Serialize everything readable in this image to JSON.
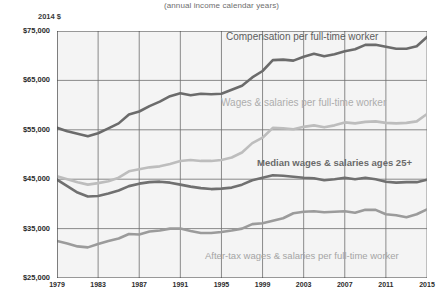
{
  "chart_data": {
    "type": "line",
    "title": "",
    "subtitle": "(annual  income calendar years)",
    "xlabel": "",
    "ylabel": "2014 $",
    "ylim": [
      25000,
      75000
    ],
    "xlim": [
      1979,
      2015
    ],
    "grid": true,
    "legend_position": "inline-annotations",
    "y_tick_labels": [
      "$75,000",
      "$65,000",
      "$55,000",
      "$45,000",
      "$35,000",
      "$25,000"
    ],
    "y_tick_values": [
      75000,
      65000,
      55000,
      45000,
      35000,
      25000
    ],
    "x_tick_labels": [
      "1979",
      "1983",
      "1987",
      "1991",
      "1995",
      "1999",
      "2003",
      "2007",
      "2011",
      "2015"
    ],
    "x_tick_values": [
      1979,
      1983,
      1987,
      1991,
      1995,
      1999,
      2003,
      2007,
      2011,
      2015
    ],
    "x": [
      1979,
      1980,
      1981,
      1982,
      1983,
      1984,
      1985,
      1986,
      1987,
      1988,
      1989,
      1990,
      1991,
      1992,
      1993,
      1994,
      1995,
      1996,
      1997,
      1998,
      1999,
      2000,
      2001,
      2002,
      2003,
      2004,
      2005,
      2006,
      2007,
      2008,
      2009,
      2010,
      2011,
      2012,
      2013,
      2014,
      2015
    ],
    "series": [
      {
        "name": "Compensation per full-time worker",
        "color": "#6b6b6b",
        "width": 2.6,
        "values": [
          55400,
          54700,
          54200,
          53700,
          54300,
          55300,
          56300,
          58100,
          58700,
          59800,
          60700,
          61800,
          62400,
          62000,
          62300,
          62200,
          62300,
          63100,
          63900,
          65600,
          66900,
          69100,
          69200,
          69000,
          69800,
          70400,
          69900,
          70300,
          70900,
          71300,
          72200,
          72200,
          71800,
          71400,
          71400,
          71900,
          73800
        ]
      },
      {
        "name": "Wages & salaries per full-time worker",
        "color": "#bdbdbd",
        "width": 2.6,
        "values": [
          45600,
          45000,
          44400,
          43900,
          44200,
          44600,
          45300,
          46600,
          47000,
          47400,
          47600,
          48100,
          48700,
          48900,
          48700,
          48700,
          48900,
          49400,
          50400,
          52300,
          53400,
          55400,
          55300,
          55100,
          55600,
          55900,
          55500,
          55900,
          56500,
          56300,
          56600,
          56700,
          56400,
          56300,
          56400,
          56700,
          58200
        ]
      },
      {
        "name": "Median wages & salaries ages 25+",
        "color": "#707070",
        "width": 2.6,
        "values": [
          44900,
          43600,
          42300,
          41500,
          41600,
          42100,
          42700,
          43600,
          44100,
          44400,
          44500,
          44300,
          43900,
          43500,
          43200,
          43000,
          43100,
          43300,
          43900,
          44800,
          45300,
          45800,
          45700,
          45500,
          45300,
          45200,
          44800,
          45000,
          45300,
          45000,
          45300,
          45000,
          44500,
          44300,
          44400,
          44400,
          44900
        ]
      },
      {
        "name": "After-tax wages & salaries per full-time worker",
        "color": "#9b9b9b",
        "width": 2.6,
        "values": [
          32500,
          32000,
          31400,
          31200,
          31900,
          32500,
          33000,
          33900,
          33800,
          34400,
          34600,
          35000,
          35000,
          34500,
          34100,
          34100,
          34300,
          34600,
          35000,
          35900,
          36100,
          36600,
          37100,
          38100,
          38400,
          38500,
          38300,
          38400,
          38500,
          38200,
          38800,
          38800,
          37900,
          37700,
          37300,
          37900,
          38900
        ]
      }
    ],
    "annotations": [
      {
        "id": "compensation",
        "text": "Compensation per full-time worker"
      },
      {
        "id": "wages-salaries",
        "text": "Wages & salaries per full-time worker"
      },
      {
        "id": "median-wages",
        "text": "Median wages & salaries ages 25+"
      },
      {
        "id": "after-tax",
        "text": "After-tax wages & salaries per full-time worker"
      }
    ],
    "colors": {
      "plot_background": "#f4f4f4",
      "page_background": "#ffffff",
      "gridline": "#6f6f6f",
      "axis": "#3c3c3c",
      "tick_text": "#2b2b2b"
    }
  }
}
